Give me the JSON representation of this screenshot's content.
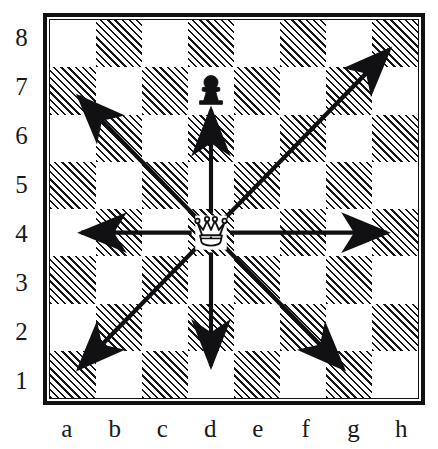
{
  "diagram": {
    "type": "chessboard",
    "board_size": 8,
    "ranks": [
      "8",
      "7",
      "6",
      "5",
      "4",
      "3",
      "2",
      "1"
    ],
    "files": [
      "a",
      "b",
      "c",
      "d",
      "e",
      "f",
      "g",
      "h"
    ],
    "light_square_color": "#ffffff",
    "dark_square_fill": "hatched-45deg",
    "dark_square_line_color": "#161618",
    "border_color": "#111113",
    "label_color": "#19191c",
    "arrow_color": "#111113"
  },
  "pieces": [
    {
      "id": "queen-d4",
      "type": "queen",
      "color": "white",
      "square": "d4",
      "file": "d",
      "rank": "4",
      "glyph": "white-queen-icon"
    },
    {
      "id": "pawn-d7",
      "type": "pawn",
      "color": "black",
      "square": "d7",
      "file": "d",
      "rank": "7",
      "glyph": "black-pawn-icon"
    }
  ],
  "arrows": [
    {
      "id": "arrow-north",
      "direction": "north",
      "from": "d4",
      "to": "d7",
      "label": "up"
    },
    {
      "id": "arrow-south",
      "direction": "south",
      "from": "d4",
      "to": "d1",
      "label": "down"
    },
    {
      "id": "arrow-west",
      "direction": "west",
      "from": "d4",
      "to": "a4",
      "label": "left"
    },
    {
      "id": "arrow-east",
      "direction": "east",
      "from": "d4",
      "to": "h4",
      "label": "right"
    },
    {
      "id": "arrow-northwest",
      "direction": "northwest",
      "from": "d4",
      "to": "a7",
      "label": "up-left"
    },
    {
      "id": "arrow-northeast",
      "direction": "northeast",
      "from": "d4",
      "to": "h8",
      "label": "up-right"
    },
    {
      "id": "arrow-southwest",
      "direction": "southwest",
      "from": "d4",
      "to": "a1",
      "label": "down-left"
    },
    {
      "id": "arrow-southeast",
      "direction": "southeast",
      "from": "d4",
      "to": "g1",
      "label": "down-right"
    }
  ],
  "squares": {
    "pattern_note": "a8 light; dark squares hatched",
    "rows": [
      [
        "light",
        "dark",
        "light",
        "dark",
        "light",
        "dark",
        "light",
        "dark"
      ],
      [
        "dark",
        "light",
        "dark",
        "light",
        "dark",
        "light",
        "dark",
        "light"
      ],
      [
        "light",
        "dark",
        "light",
        "dark",
        "light",
        "dark",
        "light",
        "dark"
      ],
      [
        "dark",
        "light",
        "dark",
        "light",
        "dark",
        "light",
        "dark",
        "light"
      ],
      [
        "light",
        "dark",
        "light",
        "dark",
        "light",
        "dark",
        "light",
        "dark"
      ],
      [
        "dark",
        "light",
        "dark",
        "light",
        "dark",
        "light",
        "dark",
        "light"
      ],
      [
        "light",
        "dark",
        "light",
        "dark",
        "light",
        "dark",
        "light",
        "dark"
      ],
      [
        "dark",
        "light",
        "dark",
        "light",
        "dark",
        "light",
        "dark",
        "light"
      ]
    ]
  }
}
